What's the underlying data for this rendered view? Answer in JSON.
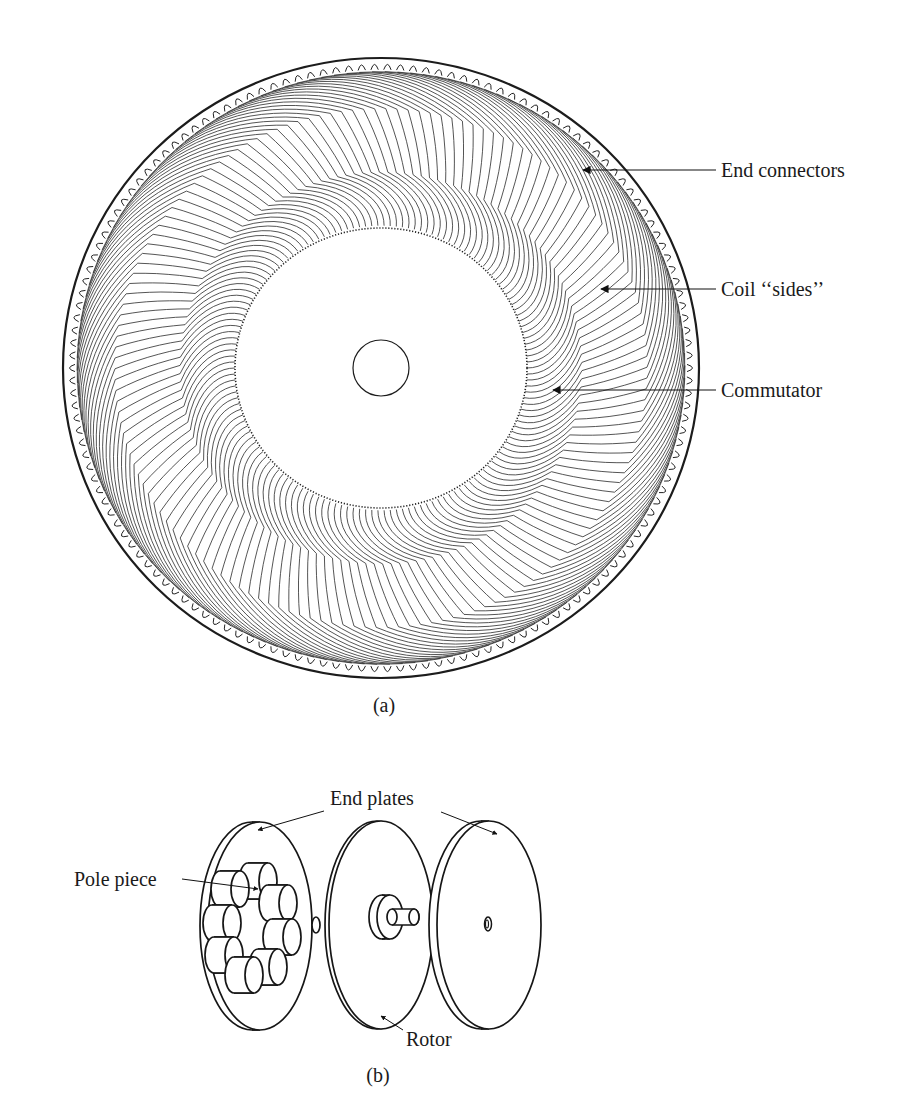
{
  "figure_a": {
    "caption": "(a)",
    "disc": {
      "center": [
        381,
        368
      ],
      "outer_rx": 318,
      "outer_ry": 310,
      "commutator_rx": 146,
      "commutator_ry": 140,
      "hub_r": 28,
      "conductor_count": 150
    },
    "labels": [
      {
        "id": "end-connectors",
        "text": "End connectors",
        "x": 721,
        "y": 177,
        "arrow_from": [
          716,
          170
        ],
        "arrow_to": [
          583,
          170
        ]
      },
      {
        "id": "coil-sides",
        "text": "Coil ‘‘sides’’",
        "x": 721,
        "y": 296,
        "arrow_from": [
          716,
          289
        ],
        "arrow_to": [
          601,
          289
        ]
      },
      {
        "id": "commutator",
        "text": "Commutator",
        "x": 721,
        "y": 397,
        "arrow_from": [
          716,
          390
        ],
        "arrow_to": [
          553,
          390
        ]
      }
    ]
  },
  "figure_b": {
    "caption": "(b)",
    "labels": {
      "end_plates": "End plates",
      "pole_piece": "Pole piece",
      "rotor": "Rotor"
    },
    "parts": [
      "left end plate with pole pieces",
      "rotor disc with shaft",
      "right end plate"
    ]
  }
}
